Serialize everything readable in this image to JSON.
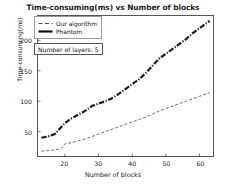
{
  "chart_data": {
    "type": "line",
    "title": "Time-consuming(ms) vs Number of blocks",
    "xlabel": "Number of blocks",
    "ylabel": "Time-consuming(ms)",
    "xlim": [
      12,
      64
    ],
    "ylim": [
      10,
      240
    ],
    "xticks": [
      20,
      30,
      40,
      50,
      60
    ],
    "yticks": [
      50,
      100,
      150,
      200
    ],
    "grid": false,
    "legend_position": "upper left",
    "annotations": [
      {
        "text": "Number of layers: 5",
        "boxed": true
      }
    ],
    "series": [
      {
        "name": "Our algorithm",
        "linestyle": "dashed",
        "color": "#6b6b6b",
        "linewidth": 1.0,
        "x": [
          13,
          15,
          17,
          19,
          20,
          22,
          24,
          26,
          28,
          30,
          32,
          34,
          36,
          38,
          40,
          42,
          44,
          46,
          48,
          50,
          52,
          54,
          56,
          58,
          60,
          62,
          63
        ],
        "y": [
          18,
          19,
          20,
          22,
          30,
          32,
          35,
          38,
          42,
          46,
          50,
          54,
          58,
          62,
          66,
          70,
          74,
          79,
          84,
          88,
          92,
          96,
          100,
          104,
          108,
          112,
          114
        ]
      },
      {
        "name": "Phantom",
        "linestyle": "dashdot",
        "color": "#1a1a1a",
        "linewidth": 2.2,
        "x": [
          13,
          15,
          17,
          19,
          20,
          22,
          24,
          26,
          28,
          30,
          32,
          34,
          36,
          38,
          40,
          42,
          44,
          46,
          48,
          50,
          52,
          54,
          56,
          58,
          60,
          62,
          63
        ],
        "y": [
          40,
          42,
          46,
          58,
          64,
          72,
          78,
          84,
          92,
          96,
          100,
          105,
          112,
          120,
          128,
          136,
          146,
          158,
          170,
          178,
          186,
          194,
          202,
          212,
          220,
          228,
          232
        ]
      }
    ]
  },
  "legend": {
    "items": [
      {
        "label": "Our algorithm",
        "style": "dashed"
      },
      {
        "label": "Phantom",
        "style": "solid"
      }
    ]
  }
}
